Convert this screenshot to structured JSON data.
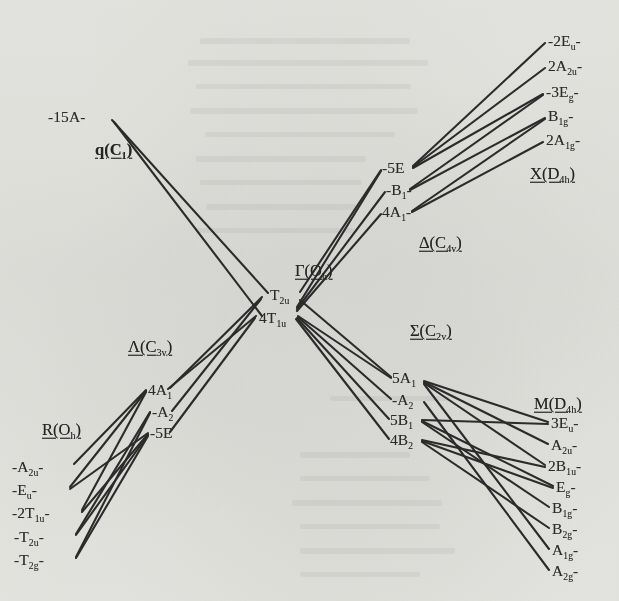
{
  "figure": {
    "kind": "correlation-diagram",
    "ink_color": "#2b2b2b",
    "paper_color": "#f2f2f0"
  },
  "headers": [
    {
      "id": "q",
      "text": "q(C1)",
      "main": "q",
      "sub_group": "C",
      "sub_index": "1",
      "x": 95,
      "y": 150,
      "bold_main": true
    },
    {
      "id": "gamma",
      "text": "Γ(Oh)",
      "main": "Γ",
      "sub_group": "O",
      "sub_index": "h",
      "x": 295,
      "y": 271,
      "bold_main": false
    },
    {
      "id": "delta",
      "text": "Δ(C4v)",
      "main": "Δ",
      "sub_group": "C",
      "sub_index": "4v",
      "x": 419,
      "y": 243,
      "bold_main": false
    },
    {
      "id": "sigma",
      "text": "Σ(C2v)",
      "main": "Σ",
      "sub_group": "C",
      "sub_index": "2v",
      "x": 410,
      "y": 331,
      "bold_main": false
    },
    {
      "id": "lambda",
      "text": "Λ(C3v)",
      "main": "Λ",
      "sub_group": "C",
      "sub_index": "3v",
      "x": 128,
      "y": 347,
      "bold_main": false
    },
    {
      "id": "x",
      "text": "X(D4h)",
      "main": "X",
      "sub_group": "D",
      "sub_index": "4h",
      "x": 530,
      "y": 174,
      "bold_main": false
    },
    {
      "id": "m",
      "text": "M(D4h)",
      "main": "M",
      "sub_group": "D",
      "sub_index": "4h",
      "x": 534,
      "y": 404,
      "bold_main": false
    },
    {
      "id": "r",
      "text": "R(Oh)",
      "main": "R",
      "sub_group": "O",
      "sub_index": "h",
      "x": 42,
      "y": 430,
      "bold_main": false
    }
  ],
  "columns": {
    "q": {
      "label": "q(C1)",
      "align": "left",
      "levels": [
        {
          "id": "q-15A",
          "text": "-15A-",
          "main": "-15A-",
          "sub": "",
          "x": 48,
          "y": 117
        }
      ]
    },
    "gamma": {
      "label": "Γ(Oh)",
      "align": "left",
      "levels": [
        {
          "id": "g-T2u",
          "text": "T2u",
          "main": "T",
          "sub": "2u",
          "x": 270,
          "y": 295
        },
        {
          "id": "g-4T1u",
          "text": "4T1u",
          "main": "4T",
          "sub": "1u",
          "x": 259,
          "y": 318
        }
      ]
    },
    "delta": {
      "label": "Δ(C4v)",
      "align": "left",
      "levels": [
        {
          "id": "d-5E",
          "text": "-5E",
          "main": "-5E",
          "sub": "",
          "x": 382,
          "y": 168
        },
        {
          "id": "d-B1",
          "text": "-B1-",
          "main": "-B",
          "sub": "1",
          "x": 386,
          "y": 190,
          "trailing": "-"
        },
        {
          "id": "d-4A1",
          "text": "4A1-",
          "main": "4A",
          "sub": "1",
          "x": 382,
          "y": 212,
          "trailing": "-"
        }
      ]
    },
    "sigma": {
      "label": "Σ(C2v)",
      "align": "left",
      "levels": [
        {
          "id": "s-5A1",
          "text": "5A1",
          "main": "5A",
          "sub": "1",
          "x": 392,
          "y": 378
        },
        {
          "id": "s-A2",
          "text": "-A2",
          "main": "-A",
          "sub": "2",
          "x": 392,
          "y": 400
        },
        {
          "id": "s-5B1",
          "text": "5B1",
          "main": "5B",
          "sub": "1",
          "x": 390,
          "y": 420
        },
        {
          "id": "s-4B2",
          "text": "4B2",
          "main": "4B",
          "sub": "2",
          "x": 390,
          "y": 440
        }
      ]
    },
    "lambda": {
      "label": "Λ(C3v)",
      "align": "left",
      "levels": [
        {
          "id": "l-4A1",
          "text": "4A1",
          "main": "4A",
          "sub": "1",
          "x": 148,
          "y": 390
        },
        {
          "id": "l-A2",
          "text": "-A2",
          "main": "-A",
          "sub": "2",
          "x": 152,
          "y": 412
        },
        {
          "id": "l-5E",
          "text": "-5E",
          "main": "-5E",
          "sub": "",
          "x": 150,
          "y": 433
        }
      ]
    },
    "x": {
      "label": "X(D4h)",
      "align": "left",
      "levels": [
        {
          "id": "x-2Eu",
          "text": "-2Eu-",
          "main": "-2E",
          "sub": "u",
          "x": 548,
          "y": 41,
          "trailing": "-"
        },
        {
          "id": "x-2A2u",
          "text": "2A2u-",
          "main": "2A",
          "sub": "2u",
          "x": 548,
          "y": 66,
          "trailing": "-"
        },
        {
          "id": "x-3Eg",
          "text": "-3Eg-",
          "main": "-3E",
          "sub": "g",
          "x": 546,
          "y": 92,
          "trailing": "-"
        },
        {
          "id": "x-B1g",
          "text": "B1g-",
          "main": "B",
          "sub": "1g",
          "x": 548,
          "y": 116,
          "trailing": "-"
        },
        {
          "id": "x-2A1g",
          "text": "2A1g-",
          "main": "2A",
          "sub": "1g",
          "x": 546,
          "y": 140,
          "trailing": "-"
        }
      ]
    },
    "m": {
      "label": "M(D4h)",
      "align": "left",
      "levels": [
        {
          "id": "m-3Eu",
          "text": "3Eu-",
          "main": "3E",
          "sub": "u",
          "x": 551,
          "y": 423,
          "trailing": "-"
        },
        {
          "id": "m-A2u",
          "text": "A2u-",
          "main": "A",
          "sub": "2u",
          "x": 551,
          "y": 445,
          "trailing": "-"
        },
        {
          "id": "m-2B1u",
          "text": "2B1u-",
          "main": "2B",
          "sub": "1u",
          "x": 548,
          "y": 466,
          "trailing": "-"
        },
        {
          "id": "m-Eg",
          "text": "Eg-",
          "main": "E",
          "sub": "g",
          "x": 556,
          "y": 487,
          "trailing": "-"
        },
        {
          "id": "m-B1g",
          "text": "B1g-",
          "main": "B",
          "sub": "1g",
          "x": 552,
          "y": 508,
          "trailing": "-"
        },
        {
          "id": "m-B2g",
          "text": "B2g-",
          "main": "B",
          "sub": "2g",
          "x": 552,
          "y": 529,
          "trailing": "-"
        },
        {
          "id": "m-A1g",
          "text": "A1g-",
          "main": "A",
          "sub": "1g",
          "x": 552,
          "y": 550,
          "trailing": "-"
        },
        {
          "id": "m-A2g",
          "text": "A2g-",
          "main": "A",
          "sub": "2g",
          "x": 552,
          "y": 571,
          "trailing": "-"
        }
      ]
    },
    "r": {
      "label": "R(Oh)",
      "align": "left",
      "levels": [
        {
          "id": "r-A2u",
          "text": "-A2u-",
          "main": "-A",
          "sub": "2u",
          "x": 12,
          "y": 467,
          "trailing": "-"
        },
        {
          "id": "r-Eu",
          "text": "-Eu-",
          "main": "-E",
          "sub": "u",
          "x": 12,
          "y": 490,
          "trailing": "-"
        },
        {
          "id": "r-2T1u",
          "text": "-2T1u-",
          "main": "-2T",
          "sub": "1u",
          "x": 12,
          "y": 513,
          "trailing": "-"
        },
        {
          "id": "r-T2u",
          "text": "-T2u-",
          "main": "-T",
          "sub": "2u",
          "x": 14,
          "y": 537,
          "trailing": "-"
        },
        {
          "id": "r-T2g",
          "text": "-T2g-",
          "main": "-T",
          "sub": "2g",
          "x": 14,
          "y": 560,
          "trailing": "-"
        }
      ]
    }
  },
  "edges": [
    {
      "id": "e-q-gamma-1",
      "from": "q-15A",
      "to": "g-T2u",
      "x1": 112,
      "y1": 120,
      "x2": 268,
      "y2": 293
    },
    {
      "id": "e-q-gamma-2",
      "from": "q-15A",
      "to": "g-4T1u",
      "x1": 114,
      "y1": 122,
      "x2": 262,
      "y2": 316
    },
    {
      "id": "e-gamma-delta-1",
      "from": "g-T2u",
      "to": "d-5E",
      "x1": 300,
      "y1": 292,
      "x2": 381,
      "y2": 170
    },
    {
      "id": "e-gamma-delta-2",
      "from": "g-4T1u",
      "to": "d-5E",
      "x1": 297,
      "y1": 307,
      "x2": 381,
      "y2": 171
    },
    {
      "id": "e-gamma-delta-3",
      "from": "g-4T1u",
      "to": "d-B1",
      "x1": 297,
      "y1": 309,
      "x2": 385,
      "y2": 192
    },
    {
      "id": "e-gamma-delta-4",
      "from": "g-4T1u",
      "to": "d-4A1",
      "x1": 297,
      "y1": 311,
      "x2": 381,
      "y2": 214
    },
    {
      "id": "e-gamma-sigma-1",
      "from": "g-T2u",
      "to": "s-5A1",
      "x1": 300,
      "y1": 300,
      "x2": 391,
      "y2": 377
    },
    {
      "id": "e-gamma-sigma-2",
      "from": "g-4T1u",
      "to": "s-5A1",
      "x1": 298,
      "y1": 316,
      "x2": 391,
      "y2": 378
    },
    {
      "id": "e-gamma-sigma-3",
      "from": "g-4T1u",
      "to": "s-A2",
      "x1": 298,
      "y1": 317,
      "x2": 391,
      "y2": 399
    },
    {
      "id": "e-gamma-sigma-4",
      "from": "g-4T1u",
      "to": "s-5B1",
      "x1": 297,
      "y1": 318,
      "x2": 389,
      "y2": 419
    },
    {
      "id": "e-gamma-sigma-5",
      "from": "g-4T1u",
      "to": "s-4B2",
      "x1": 296,
      "y1": 319,
      "x2": 389,
      "y2": 439
    },
    {
      "id": "e-gamma-lambda-1",
      "from": "g-T2u",
      "to": "l-4A1",
      "x1": 262,
      "y1": 297,
      "x2": 170,
      "y2": 388
    },
    {
      "id": "e-gamma-lambda-2",
      "from": "g-4T1u",
      "to": "l-4A1",
      "x1": 256,
      "y1": 316,
      "x2": 168,
      "y2": 389
    },
    {
      "id": "e-gamma-lambda-3",
      "from": "g-T2u",
      "to": "l-A2",
      "x1": 261,
      "y1": 299,
      "x2": 172,
      "y2": 411
    },
    {
      "id": "e-gamma-lambda-4",
      "from": "g-4T1u",
      "to": "l-5E",
      "x1": 255,
      "y1": 318,
      "x2": 170,
      "y2": 432
    },
    {
      "id": "e-delta-x-1",
      "from": "d-5E",
      "to": "x-2Eu",
      "x1": 413,
      "y1": 166,
      "x2": 545,
      "y2": 43
    },
    {
      "id": "e-delta-x-2",
      "from": "d-5E",
      "to": "x-2A2u",
      "x1": 413,
      "y1": 167,
      "x2": 545,
      "y2": 68
    },
    {
      "id": "e-delta-x-3",
      "from": "d-5E",
      "to": "x-3Eg",
      "x1": 413,
      "y1": 168,
      "x2": 543,
      "y2": 94
    },
    {
      "id": "e-delta-x-4",
      "from": "d-B1",
      "to": "x-3Eg",
      "x1": 410,
      "y1": 189,
      "x2": 543,
      "y2": 95
    },
    {
      "id": "e-delta-x-5",
      "from": "d-B1",
      "to": "x-B1g",
      "x1": 410,
      "y1": 190,
      "x2": 545,
      "y2": 118
    },
    {
      "id": "e-delta-x-6",
      "from": "d-4A1",
      "to": "x-B1g",
      "x1": 412,
      "y1": 211,
      "x2": 545,
      "y2": 119
    },
    {
      "id": "e-delta-x-7",
      "from": "d-4A1",
      "to": "x-2A1g",
      "x1": 412,
      "y1": 212,
      "x2": 543,
      "y2": 142
    },
    {
      "id": "e-sigma-m-1",
      "from": "s-5A1",
      "to": "m-3Eu",
      "x1": 424,
      "y1": 381,
      "x2": 548,
      "y2": 422
    },
    {
      "id": "e-sigma-m-2",
      "from": "s-5A1",
      "to": "m-A2u",
      "x1": 424,
      "y1": 382,
      "x2": 548,
      "y2": 444
    },
    {
      "id": "e-sigma-m-3",
      "from": "s-5A1",
      "to": "m-2B1u",
      "x1": 424,
      "y1": 383,
      "x2": 545,
      "y2": 465
    },
    {
      "id": "e-sigma-m-4",
      "from": "s-5A1",
      "to": "m-A1g",
      "x1": 424,
      "y1": 384,
      "x2": 549,
      "y2": 549
    },
    {
      "id": "e-sigma-m-5",
      "from": "s-A2",
      "to": "m-A2g",
      "x1": 424,
      "y1": 402,
      "x2": 549,
      "y2": 570
    },
    {
      "id": "e-sigma-m-6",
      "from": "s-5B1",
      "to": "m-3Eu",
      "x1": 422,
      "y1": 420,
      "x2": 548,
      "y2": 424
    },
    {
      "id": "e-sigma-m-7",
      "from": "s-5B1",
      "to": "m-Eg",
      "x1": 422,
      "y1": 421,
      "x2": 553,
      "y2": 486
    },
    {
      "id": "e-sigma-m-8",
      "from": "s-5B1",
      "to": "m-B1g",
      "x1": 422,
      "y1": 422,
      "x2": 549,
      "y2": 507
    },
    {
      "id": "e-sigma-m-9",
      "from": "s-4B2",
      "to": "m-2B1u",
      "x1": 422,
      "y1": 440,
      "x2": 545,
      "y2": 467
    },
    {
      "id": "e-sigma-m-10",
      "from": "s-4B2",
      "to": "m-Eg",
      "x1": 422,
      "y1": 441,
      "x2": 553,
      "y2": 488
    },
    {
      "id": "e-sigma-m-11",
      "from": "s-4B2",
      "to": "m-B2g",
      "x1": 422,
      "y1": 442,
      "x2": 549,
      "y2": 528
    },
    {
      "id": "e-r-lambda-1",
      "from": "r-A2u",
      "to": "l-4A1",
      "x1": 74,
      "y1": 464,
      "x2": 146,
      "y2": 390
    },
    {
      "id": "e-r-lambda-2",
      "from": "r-Eu",
      "to": "l-4A1",
      "x1": 70,
      "y1": 487,
      "x2": 146,
      "y2": 391
    },
    {
      "id": "e-r-lambda-3",
      "from": "r-2T1u",
      "to": "l-4A1",
      "x1": 82,
      "y1": 510,
      "x2": 146,
      "y2": 392
    },
    {
      "id": "e-r-lambda-4",
      "from": "r-Eu",
      "to": "l-5E",
      "x1": 70,
      "y1": 489,
      "x2": 148,
      "y2": 433
    },
    {
      "id": "e-r-lambda-5",
      "from": "r-2T1u",
      "to": "l-5E",
      "x1": 82,
      "y1": 512,
      "x2": 148,
      "y2": 434
    },
    {
      "id": "e-r-lambda-6",
      "from": "r-T2u",
      "to": "l-A2",
      "x1": 76,
      "y1": 534,
      "x2": 150,
      "y2": 412
    },
    {
      "id": "e-r-lambda-7",
      "from": "r-T2u",
      "to": "l-5E",
      "x1": 76,
      "y1": 535,
      "x2": 148,
      "y2": 435
    },
    {
      "id": "e-r-lambda-8",
      "from": "r-T2g",
      "to": "l-A2",
      "x1": 76,
      "y1": 557,
      "x2": 150,
      "y2": 413
    },
    {
      "id": "e-r-lambda-9",
      "from": "r-T2g",
      "to": "l-5E",
      "x1": 76,
      "y1": 558,
      "x2": 148,
      "y2": 436
    }
  ],
  "ghost_marks": [
    {
      "x": 200,
      "y": 38,
      "w": 210,
      "h": 6
    },
    {
      "x": 188,
      "y": 60,
      "w": 240,
      "h": 6
    },
    {
      "x": 196,
      "y": 84,
      "w": 215,
      "h": 5
    },
    {
      "x": 190,
      "y": 108,
      "w": 228,
      "h": 6
    },
    {
      "x": 205,
      "y": 132,
      "w": 190,
      "h": 5
    },
    {
      "x": 196,
      "y": 156,
      "w": 170,
      "h": 6
    },
    {
      "x": 200,
      "y": 180,
      "w": 162,
      "h": 5
    },
    {
      "x": 206,
      "y": 204,
      "w": 150,
      "h": 6
    },
    {
      "x": 196,
      "y": 228,
      "w": 158,
      "h": 5
    },
    {
      "x": 330,
      "y": 396,
      "w": 120,
      "h": 5
    },
    {
      "x": 300,
      "y": 452,
      "w": 110,
      "h": 6
    },
    {
      "x": 300,
      "y": 476,
      "w": 130,
      "h": 5
    },
    {
      "x": 292,
      "y": 500,
      "w": 150,
      "h": 6
    },
    {
      "x": 300,
      "y": 524,
      "w": 140,
      "h": 5
    },
    {
      "x": 300,
      "y": 548,
      "w": 155,
      "h": 6
    },
    {
      "x": 300,
      "y": 572,
      "w": 120,
      "h": 5
    }
  ]
}
